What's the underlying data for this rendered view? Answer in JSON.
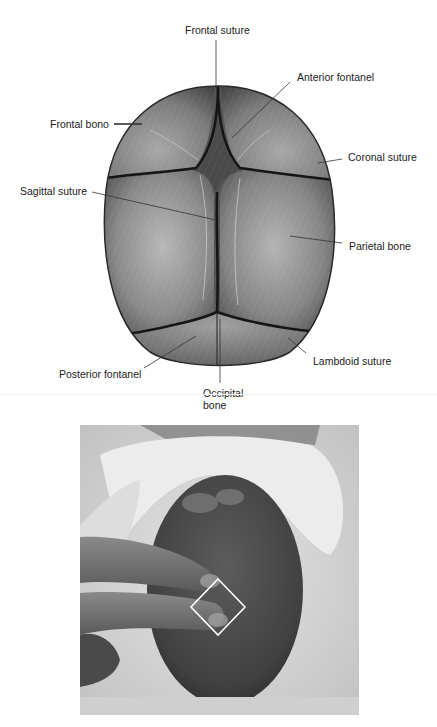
{
  "diagram": {
    "labels": {
      "frontal_suture": "Frontal suture",
      "anterior_fontanel": "Anterior fontanel",
      "frontal_bone": "Frontal bono",
      "coronal_suture": "Coronal suture",
      "sagittal_suture": "Sagittal suture",
      "parietal_bone": "Parietal bone",
      "posterior_fontanel": "Posterior fontanel",
      "lambdoid_suture": "Lambdoid suture",
      "occipital_bone_line1": "Occipital",
      "occipital_bone_line2": "bone"
    },
    "colors": {
      "skull_dark": "#3a3a3a",
      "skull_mid": "#7a7a7a",
      "suture": "#141414",
      "leader_line": "#333333"
    }
  },
  "photo": {
    "description": "Examiner palpating posterior fontanel of newborn with two fingers",
    "highlight_shape": "diamond",
    "highlight_color": "#ffffff"
  }
}
